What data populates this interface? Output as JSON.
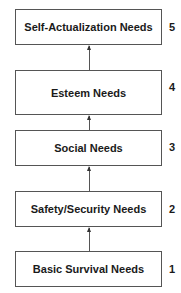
{
  "diagram": {
    "type": "hierarchy",
    "levels": [
      {
        "label": "Self-Actualization Needs",
        "number": "5"
      },
      {
        "label": "Esteem Needs",
        "number": "4"
      },
      {
        "label": "Social Needs",
        "number": "3"
      },
      {
        "label": "Safety/Security Needs",
        "number": "2"
      },
      {
        "label": "Basic Survival Needs",
        "number": "1"
      }
    ]
  }
}
